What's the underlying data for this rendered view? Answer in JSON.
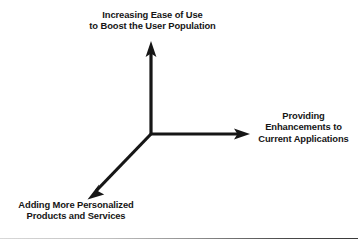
{
  "diagram": {
    "background_color": "#ffffff",
    "line_color": "#161616",
    "origin": {
      "x": 151,
      "y": 134
    },
    "axes": [
      {
        "id": "vertical",
        "direction": "up",
        "tip": {
          "x": 151,
          "y": 42
        },
        "label_lines": [
          "Increasing Ease of Use",
          "to Boost the User Population"
        ]
      },
      {
        "id": "horizontal",
        "direction": "right",
        "tip": {
          "x": 249,
          "y": 134
        },
        "label_lines": [
          "Providing",
          "Enhancements to",
          "Current Applications"
        ]
      },
      {
        "id": "diagonal",
        "direction": "down-left",
        "tip": {
          "x": 88,
          "y": 199
        },
        "label_lines": [
          "Adding More Personalized",
          "Products and Services"
        ]
      }
    ]
  }
}
